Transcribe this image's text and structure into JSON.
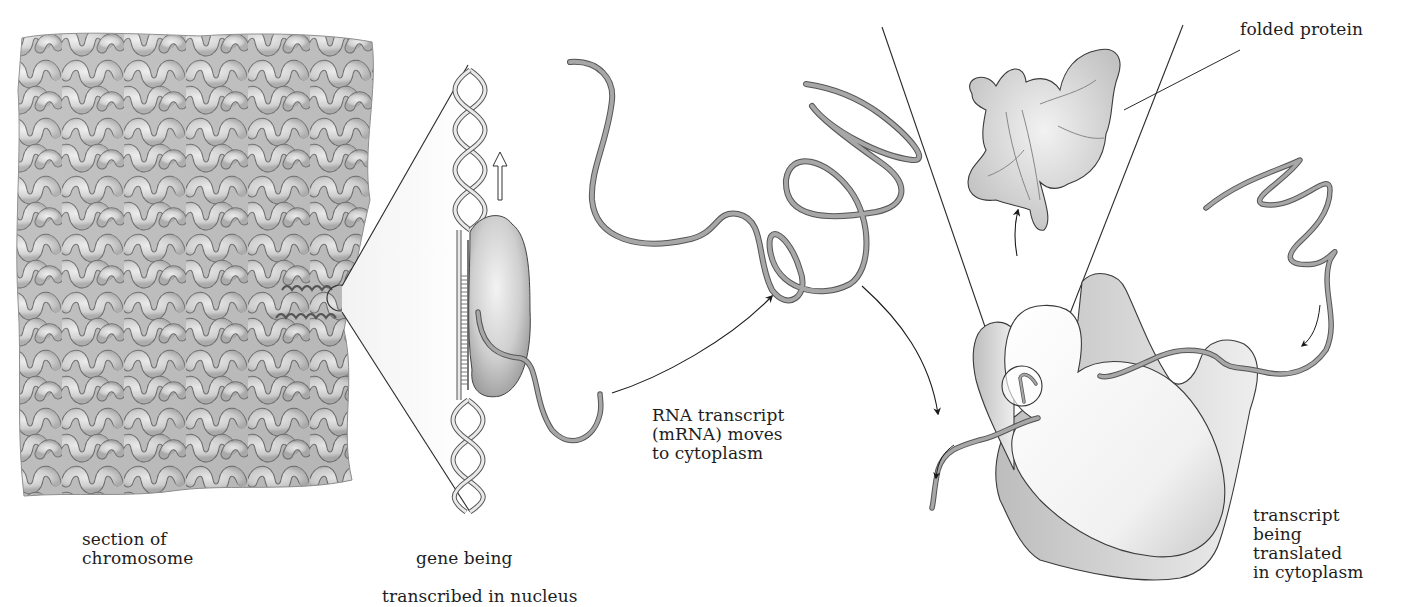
{
  "figure": {
    "colors": {
      "background": "#ffffff",
      "line": "#2a2a2a",
      "strand": "#8a8a8a",
      "shading": "#cfcfcf"
    },
    "labels": {
      "chromosome": "section of\nchromosome",
      "gene_line1": "gene being",
      "gene_line2": "transcribed in nucleus",
      "rna": "RNA transcript\n(mRNA) moves\nto cytoplasm",
      "folded_protein": "folded protein",
      "translated": "transcript\nbeing\ntranslated\nin cytoplasm"
    },
    "elements": [
      "section-of-chromosome",
      "dna-double-helix",
      "rna-polymerase",
      "transcription-direction-arrow",
      "mrna-strand",
      "ribosome",
      "folded-protein"
    ]
  }
}
